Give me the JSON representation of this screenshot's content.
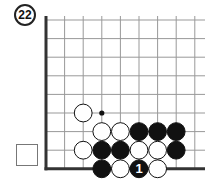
{
  "problem": {
    "number": "22"
  },
  "turn_indicator": {
    "shape": "square",
    "fill": "none"
  },
  "board": {
    "origin": {
      "x": 46,
      "y": 20
    },
    "spacing": 18.6,
    "columns": 9,
    "rows": 9,
    "line_color": "#999999",
    "edge_color": "#333333",
    "edges": [
      "left",
      "bottom"
    ],
    "right_extent": 205
  },
  "stones": [
    {
      "col": 2,
      "row": 5,
      "color": "white"
    },
    {
      "col": 3,
      "row": 6,
      "color": "white"
    },
    {
      "col": 4,
      "row": 6,
      "color": "white"
    },
    {
      "col": 5,
      "row": 6,
      "color": "black"
    },
    {
      "col": 6,
      "row": 6,
      "color": "black"
    },
    {
      "col": 7,
      "row": 6,
      "color": "black"
    },
    {
      "col": 2,
      "row": 7,
      "color": "white"
    },
    {
      "col": 3,
      "row": 7,
      "color": "black"
    },
    {
      "col": 4,
      "row": 7,
      "color": "black"
    },
    {
      "col": 5,
      "row": 7,
      "color": "white"
    },
    {
      "col": 6,
      "row": 7,
      "color": "white"
    },
    {
      "col": 7,
      "row": 7,
      "color": "black"
    },
    {
      "col": 3,
      "row": 8,
      "color": "black"
    },
    {
      "col": 4,
      "row": 8,
      "color": "white"
    },
    {
      "col": 5,
      "row": 8,
      "color": "black",
      "label": "1"
    },
    {
      "col": 6,
      "row": 8,
      "color": "white"
    }
  ],
  "markers": [
    {
      "col": 3,
      "row": 5,
      "type": "dot"
    }
  ]
}
